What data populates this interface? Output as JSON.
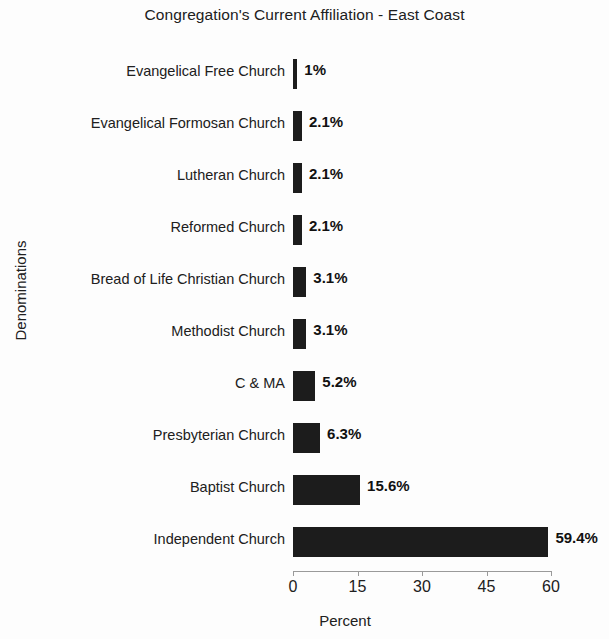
{
  "chart_data": {
    "type": "bar",
    "orientation": "horizontal",
    "title": "Congregation's Current Affiliation - East Coast",
    "xlabel": "Percent",
    "ylabel": "Denominations",
    "categories": [
      "Evangelical Free Church",
      "Evangelical Formosan Church",
      "Lutheran Church",
      "Reformed Church",
      "Bread of Life Christian Church",
      "Methodist Church",
      "C & MA",
      "Presbyterian Church",
      "Baptist Church",
      "Independent Church"
    ],
    "values": [
      1,
      2.1,
      2.1,
      2.1,
      3.1,
      3.1,
      5.2,
      6.3,
      15.6,
      59.4
    ],
    "value_labels": [
      "1%",
      "2.1%",
      "2.1%",
      "2.1%",
      "3.1%",
      "3.1%",
      "5.2%",
      "6.3%",
      "15.6%",
      "59.4%"
    ],
    "xticks": [
      0,
      15,
      30,
      45,
      60
    ],
    "xtick_labels": [
      "0",
      "15",
      "30",
      "45",
      "60"
    ],
    "xlim": [
      0,
      60
    ],
    "grid": false,
    "legend": null,
    "bar_color": "#1c1c1c",
    "background_color": "#fdfdfd"
  }
}
